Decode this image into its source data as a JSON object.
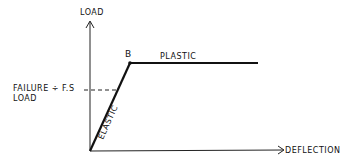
{
  "diagram": {
    "type": "load-deflection",
    "axes": {
      "y_label": "LOAD",
      "x_label": "DEFLECTION"
    },
    "point_label": "B",
    "segments": {
      "elastic": "ELASTIC",
      "plastic": "PLASTIC"
    },
    "annotation": {
      "line1": "FAILURE",
      "divide": "÷",
      "fos": "F.S",
      "line2": "LOAD"
    },
    "colors": {
      "ink": "#111111",
      "background": "#ffffff"
    }
  }
}
